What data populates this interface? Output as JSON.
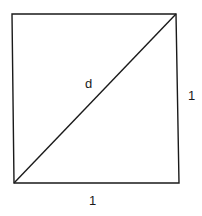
{
  "diagram": {
    "type": "unit-square-with-diagonal",
    "labels": {
      "diagonal": "d",
      "right_side": "1",
      "bottom_side": "1"
    },
    "colors": {
      "stroke": "#1a1a1a",
      "background": "#ffffff"
    },
    "geometry": {
      "top_left": [
        12,
        14
      ],
      "top_right": [
        176,
        14
      ],
      "bottom_right": [
        179,
        183
      ],
      "bottom_left": [
        14,
        183
      ]
    }
  }
}
